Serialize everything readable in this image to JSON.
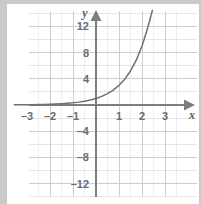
{
  "chart_data": {
    "type": "line",
    "title": "",
    "subtitle": "",
    "xlabel": "x",
    "ylabel": "y",
    "xlim": [
      -3.6,
      3.75
    ],
    "ylim": [
      -14,
      14.5
    ],
    "grid": true,
    "legend": null,
    "x_ticks": [
      -3,
      -2,
      -1,
      1,
      2,
      3
    ],
    "x_tick_labels": [
      "–3",
      "–2",
      "–1",
      "1",
      "2",
      "3"
    ],
    "y_ticks": [
      12,
      8,
      4,
      -4,
      -8,
      -12
    ],
    "y_tick_labels": [
      "12",
      "8",
      "4",
      "–4",
      "–8",
      "–12"
    ],
    "x_minor_step": 1,
    "y_minor_step": 2,
    "series": [
      {
        "name": "y = 3^x",
        "type": "exponential",
        "base": 3,
        "x": [
          -3.55,
          -3.3,
          -3.0,
          -2.75,
          -2.5,
          -2.25,
          -2.0,
          -1.75,
          -1.5,
          -1.25,
          -1.0,
          -0.75,
          -0.5,
          -0.25,
          0.0,
          0.25,
          0.5,
          0.75,
          1.0,
          1.25,
          1.5,
          1.75,
          2.0,
          2.2,
          2.35,
          2.45
        ],
        "y": [
          0.022,
          0.031,
          0.037,
          0.051,
          0.064,
          0.086,
          0.111,
          0.148,
          0.192,
          0.255,
          0.333,
          0.439,
          0.577,
          0.76,
          1.0,
          1.316,
          1.732,
          2.28,
          3.0,
          3.948,
          5.196,
          6.84,
          9.0,
          11.21,
          13.1,
          14.45
        ],
        "key_points": [
          {
            "x": -1,
            "y": 0.333
          },
          {
            "x": 0,
            "y": 1
          },
          {
            "x": 1,
            "y": 3
          },
          {
            "x": 2,
            "y": 9
          }
        ]
      }
    ],
    "colors": {
      "curve": "#6f6f6f",
      "axis": "#7a7a7a",
      "grid_minor": "#dcdcdc",
      "grid_major": "#cfcfcf",
      "tick_text": "#6b6b6b",
      "axis_letter": "#5a5a5a",
      "plot_background": "#ffffff",
      "page_background": "#c9c9c9"
    }
  }
}
